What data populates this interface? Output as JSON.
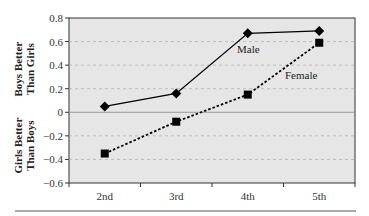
{
  "chart_data": {
    "type": "line",
    "title": "",
    "xlabel": "",
    "ylabel": "",
    "categories": [
      "2nd",
      "3rd",
      "4th",
      "5th"
    ],
    "yticks": [
      0.8,
      0.6,
      0.4,
      0.2,
      0,
      -0.2,
      -0.4,
      -0.6
    ],
    "ytick_labels": [
      "0.8",
      "0.6",
      "0.4",
      "0.2",
      "0",
      "−0.2",
      "−0.4",
      "−0.6"
    ],
    "ylim": [
      -0.6,
      0.8
    ],
    "grid": "horizontal dashed",
    "side_labels": {
      "upper": [
        "Boys Better",
        "Than Girls"
      ],
      "lower": [
        "Girls Better",
        "Than Boys"
      ]
    },
    "series": [
      {
        "name": "Male",
        "marker": "diamond",
        "line": "solid",
        "values": [
          0.05,
          0.16,
          0.67,
          0.69
        ]
      },
      {
        "name": "Female",
        "marker": "square",
        "line": "dotted",
        "values": [
          -0.35,
          -0.08,
          0.15,
          0.59
        ]
      }
    ],
    "annotations": [
      {
        "text": "Male",
        "near": "4th",
        "series": "Male"
      },
      {
        "text": "Female",
        "near": "4th-5th",
        "series": "Female"
      }
    ],
    "colors": {
      "plot_bg": "#e6e6e6",
      "line": "#000000",
      "grid": "#b0b0b0",
      "zero_line": "#9a9a9a"
    }
  }
}
